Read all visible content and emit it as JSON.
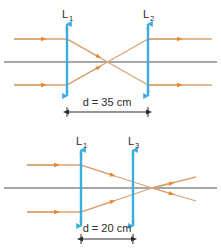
{
  "figure": {
    "colors": {
      "ray": "#d9a273",
      "ray_arrow": "#e8872b",
      "lens": "#3aaee0",
      "axis": "#8a8a8a",
      "text": "#2b2b2b",
      "background": "#ffffff"
    }
  },
  "diagrams": [
    {
      "id": "top-diagram",
      "lenses": [
        {
          "name": "lens-L1",
          "label": "L",
          "subscript": "1",
          "x": 67,
          "top_y": 22,
          "bottom_y": 98
        },
        {
          "name": "lens-L2",
          "label": "L",
          "subscript": "2",
          "x": 148,
          "top_y": 22,
          "bottom_y": 98
        }
      ],
      "axis": {
        "y": 62,
        "x_start": 4,
        "x_end": 217
      },
      "dimension": {
        "label": "d = 35 cm",
        "value": 35,
        "unit": "cm",
        "from_x": 67,
        "to_x": 148,
        "line_y": 112,
        "text_y": 103
      },
      "rays": [
        {
          "name": "ray-upper-incoming",
          "points": "14,39 67,39"
        },
        {
          "name": "ray-upper-converging",
          "points": "67,39 148,85"
        },
        {
          "name": "ray-lower-incoming",
          "points": "14,85 67,85"
        },
        {
          "name": "ray-lower-converging",
          "points": "67,85 148,39"
        },
        {
          "name": "ray-upper-outgoing",
          "points": "148,39 212,39"
        },
        {
          "name": "ray-lower-outgoing",
          "points": "148,85 212,85"
        }
      ],
      "crossing_point": {
        "x": 107,
        "y": 62
      }
    },
    {
      "id": "bottom-diagram",
      "lenses": [
        {
          "name": "lens-L1",
          "label": "L",
          "subscript": "1",
          "x": 81,
          "top_y": 148,
          "bottom_y": 228
        },
        {
          "name": "lens-L3",
          "label": "L",
          "subscript": "3",
          "x": 133,
          "top_y": 148,
          "bottom_y": 228
        }
      ],
      "axis": {
        "y": 188,
        "x_start": 4,
        "x_end": 217
      },
      "dimension": {
        "label": "d = 20 cm",
        "value": 20,
        "unit": "cm",
        "from_x": 81,
        "to_x": 133,
        "line_y": 236,
        "text_y": 228
      },
      "rays": [
        {
          "name": "ray-upper-incoming",
          "points": "27,165 81,165"
        },
        {
          "name": "ray-upper-converging",
          "points": "81,165 152,188"
        },
        {
          "name": "ray-lower-incoming",
          "points": "27,212 81,212"
        },
        {
          "name": "ray-lower-converging",
          "points": "81,212 152,188"
        },
        {
          "name": "ray-upper-outgoing",
          "points": "152,188 190,177"
        },
        {
          "name": "ray-lower-outgoing",
          "points": "152,188 190,200"
        }
      ],
      "focus_point": {
        "x": 152,
        "y": 188
      }
    }
  ]
}
